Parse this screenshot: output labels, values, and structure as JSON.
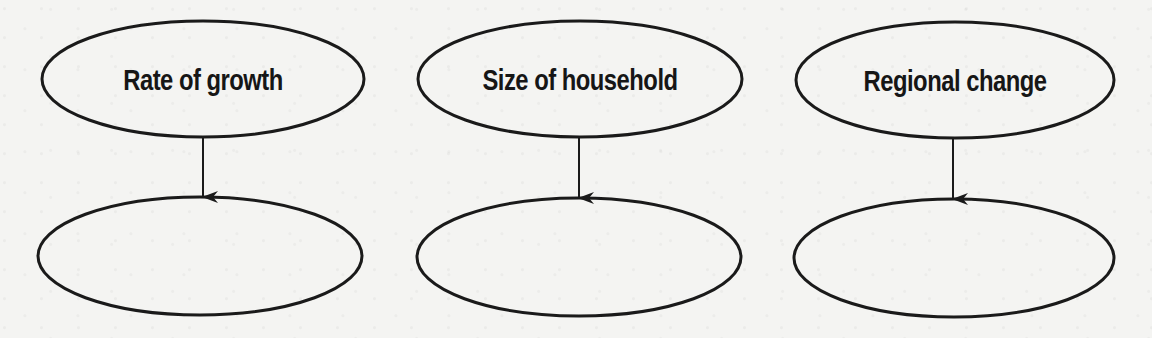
{
  "diagram": {
    "colors": {
      "background": "#f4f4f2",
      "stroke": "#1a1a1a",
      "text": "#161616"
    },
    "top_nodes": [
      {
        "label": "Rate of growth",
        "cx": 203,
        "cy": 79,
        "rx": 161,
        "ry": 58
      },
      {
        "label": "Size of household",
        "cx": 580,
        "cy": 79,
        "rx": 162,
        "ry": 58
      },
      {
        "label": "Regional change",
        "cx": 955,
        "cy": 80,
        "rx": 159,
        "ry": 58
      }
    ],
    "bottom_nodes": [
      {
        "label": "",
        "cx": 200,
        "cy": 256,
        "rx": 162,
        "ry": 59
      },
      {
        "label": "",
        "cx": 579,
        "cy": 257,
        "rx": 162,
        "ry": 59
      },
      {
        "label": "",
        "cx": 954,
        "cy": 258,
        "rx": 160,
        "ry": 59
      }
    ],
    "arrows": [
      {
        "from": 0,
        "to": 0,
        "x": 203,
        "y1": 137,
        "y2": 197
      },
      {
        "from": 1,
        "to": 1,
        "x": 579,
        "y1": 137,
        "y2": 198
      },
      {
        "from": 2,
        "to": 2,
        "x": 953,
        "y1": 138,
        "y2": 199
      }
    ]
  }
}
